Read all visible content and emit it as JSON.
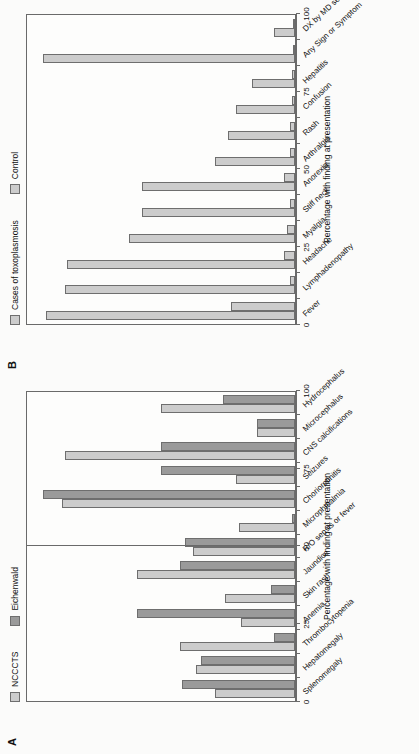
{
  "figure": {
    "panels": [
      {
        "letter": "A",
        "axis_title": "Percentage with finding at presentation",
        "legend": [
          {
            "label": "NCCCTS",
            "color": "#cccccc"
          },
          {
            "label": "Eichenwald",
            "color": "#9a9a9a"
          }
        ],
        "chart_data": {
          "type": "bar",
          "title": "",
          "xlabel": "",
          "ylabel": "Percentage with finding at presentation",
          "ylim": [
            0,
            100
          ],
          "yticks": [
            0,
            25,
            50,
            75,
            100
          ],
          "grid": false,
          "legend_position": "top-left",
          "divider_after_category": "R/O sepsis or fever",
          "categories": [
            "Splenomegaly",
            "Hepatomegaly",
            "Thrombocytopenia",
            "Anemia",
            "Skin rash",
            "Jaundice",
            "R/O sepsis or fever",
            "Microphthalmia",
            "Chorioretinitis",
            "Seizures",
            "CNS calcifications",
            "Microcephalus",
            "Hydrocephalus"
          ],
          "series": [
            {
              "name": "NCCCTS",
              "color": "#cccccc",
              "values": [
                30,
                37,
                43,
                20,
                26,
                59,
                38,
                21,
                87,
                22,
                86,
                14,
                50
              ]
            },
            {
              "name": "Eichenwald",
              "color": "#9a9a9a",
              "values": [
                42,
                35,
                8,
                59,
                9,
                43,
                41,
                1,
                94,
                50,
                50,
                14,
                27
              ]
            }
          ]
        }
      },
      {
        "letter": "B",
        "axis_title": "Percentage with finding at presentation",
        "legend": [
          {
            "label": "Cases of toxoplasmosis",
            "color": "#cccccc"
          },
          {
            "label": "Control",
            "color": "#cccccc"
          }
        ],
        "chart_data": {
          "type": "bar",
          "title": "",
          "xlabel": "",
          "ylabel": "Percentage with finding at presentation",
          "ylim": [
            0,
            100
          ],
          "yticks": [
            0,
            25,
            50,
            75,
            100
          ],
          "grid": false,
          "legend_position": "top-left",
          "categories": [
            "Fever",
            "Lymphadenopathy",
            "Headache",
            "Myalgia",
            "Stiff neck",
            "Anorexia",
            "Arthralgia",
            "Rash",
            "Confusion",
            "Hepatitis",
            "Any Sign or Symptom",
            "DX by MD seen"
          ],
          "series": [
            {
              "name": "Cases of toxoplasmosis",
              "color": "#cccccc",
              "values": [
                93,
                86,
                85,
                62,
                57,
                57,
                30,
                25,
                22,
                16,
                94,
                8
              ]
            },
            {
              "name": "Control",
              "color": "#cccccc",
              "values": [
                24,
                2,
                4,
                3,
                2,
                4,
                2,
                2,
                1,
                1,
                0.5,
                0
              ]
            }
          ]
        }
      }
    ]
  }
}
